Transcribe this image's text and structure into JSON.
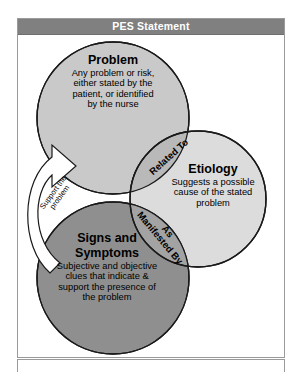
{
  "header": {
    "title": "PES Statement"
  },
  "diagram": {
    "type": "venn",
    "circles": [
      {
        "id": "problem",
        "heading": "Problem",
        "body": "Any problem or risk, either stated by the patient, or identified by the nurse",
        "body_lines": [
          "Any problem or risk,",
          "either stated by the",
          "patient, or identified",
          "by the nurse"
        ],
        "fill": "#c9c9c9",
        "stroke": "#1a1a1a"
      },
      {
        "id": "etiology",
        "heading": "Etiology",
        "body": "Suggests a possible cause of the stated problem",
        "body_lines": [
          "Suggests a possible",
          "cause of the stated",
          "problem"
        ],
        "fill": "#dcdcdc",
        "stroke": "#1a1a1a"
      },
      {
        "id": "signs",
        "heading": "Signs and Symptoms",
        "heading_lines": [
          "Signs and",
          "Symptoms"
        ],
        "body": "Subjective and objective clues that indicate & support the presence of the problem",
        "body_lines": [
          "Subjective and objective",
          "clues that indicate &",
          "support the presence of",
          "the problem"
        ],
        "fill": "#8f8f8f",
        "stroke": "#1a1a1a"
      }
    ],
    "overlaps": [
      {
        "id": "related-to",
        "label": "Related To",
        "between": [
          "problem",
          "etiology"
        ],
        "fill": "#b9b9b9"
      },
      {
        "id": "as-manifested-by",
        "label": "As Manifested By",
        "label_lines": [
          "As",
          "Manifested By"
        ],
        "between": [
          "signs",
          "etiology"
        ],
        "fill": "#a3a3a3"
      }
    ],
    "arrow": {
      "id": "support-arrow",
      "label": "Support the problem",
      "label_lines": [
        "Support the",
        "problem"
      ],
      "from": "signs",
      "to": "problem",
      "fill": "#ffffff",
      "stroke": "#1a1a1a"
    }
  },
  "colors": {
    "title_bar": "#808080",
    "title_text": "#ffffff",
    "frame_border": "#9a9a9a",
    "page_background": "#ffffff",
    "outline": "#1a1a1a"
  }
}
